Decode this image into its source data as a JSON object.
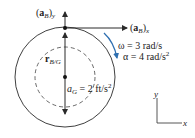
{
  "diagram": {
    "title": "",
    "colors": {
      "line": "#2a2a2a",
      "accent": "#2f6fb0",
      "background": "#ffffff"
    },
    "labels": {
      "aB_y": {
        "vec": "a",
        "sub": "B",
        "comp": "y"
      },
      "aB_x": {
        "vec": "a",
        "sub": "B",
        "comp": "x"
      },
      "omega": "ω = 3 rad/s",
      "alpha_lhs": "α = 4 rad/s",
      "alpha_exp": "2",
      "r_BG": {
        "vec": "r",
        "sub": "B/G"
      },
      "aG_lhs": "a",
      "aG_sub": "G",
      "aG_rhs": " = 2 ft/s",
      "aG_exp": "2",
      "axis_y": "y",
      "axis_x": "x"
    },
    "values": {
      "omega_rad_per_s": 3,
      "alpha_rad_per_s2": 4,
      "aG_ft_per_s2": 2
    },
    "geometry": {
      "outer_circle": {
        "cx": 65,
        "cy": 77,
        "r": 50
      },
      "inner_dashed_circle": {
        "cx": 65,
        "cy": 77,
        "r": 30
      },
      "point_B": {
        "x": 65,
        "y": 28
      },
      "point_G": {
        "x": 65,
        "y": 77
      }
    }
  }
}
